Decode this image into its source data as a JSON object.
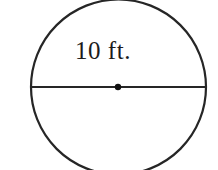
{
  "figure": {
    "type": "circle-with-diameter",
    "canvas": {
      "width": 218,
      "height": 170,
      "background": "#ffffff"
    },
    "stroke_color": "#262626",
    "circle": {
      "center_x": 118.5,
      "center_y": 87,
      "radius": 87.5,
      "stroke_width": 2.2,
      "fill": "none"
    },
    "diameter_segment": {
      "x1": 31,
      "y1": 87,
      "x2": 206,
      "y2": 87,
      "stroke_width": 1.8,
      "label": "10 ft."
    },
    "center_point": {
      "cx": 118,
      "cy": 87,
      "r": 3.2,
      "fill": "#111111"
    },
    "labels": {
      "diameter_measure": "10 ft."
    }
  }
}
